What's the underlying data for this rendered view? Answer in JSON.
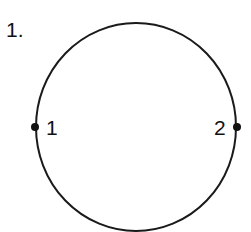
{
  "problem_number": "1.",
  "circle": {
    "cx": 136,
    "cy": 127,
    "rx": 100,
    "ry": 104,
    "stroke": "#1a1a1a"
  },
  "points": [
    {
      "label": "1",
      "x": 35,
      "y": 127
    },
    {
      "label": "2",
      "x": 237,
      "y": 127
    }
  ]
}
